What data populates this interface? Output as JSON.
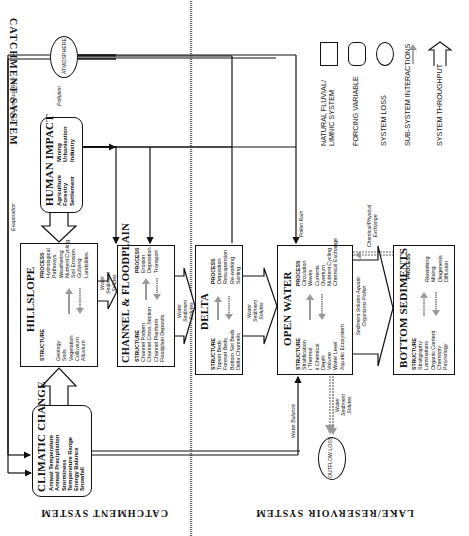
{
  "diagram": {
    "orientation": "rotated 90 degrees counter-clockwise",
    "regions": {
      "catchment": "CATCHMENT SYSTEM",
      "lake": "LAKE/RESERVOIR SYSTEM"
    },
    "nodes": {
      "climatic_change": {
        "title": "CLIMATIC CHANGE",
        "items": [
          "Annual Temperature",
          "Annual Precipitation",
          "Storminess",
          "Temperature Range",
          "Energy Balance",
          "Snowfall"
        ]
      },
      "human_impact": {
        "title": "HUMAN IMPACT",
        "items_col1": [
          "Agriculture",
          "Forestry",
          "Settlement"
        ],
        "items_col2": [
          "Mining",
          "Urbanisation",
          "Industry"
        ]
      },
      "atmosphere": {
        "title": "ATMOSPHERE"
      },
      "hillslope": {
        "title": "HILLSLOPE",
        "structure_label": "STRUCTURE",
        "process_label": "PROCESS",
        "structure": [
          "Geology",
          "Soils",
          "Vegetation",
          "Colluvium",
          "Alluvium"
        ],
        "process": [
          "Hydrological",
          "Pathways",
          "Weathering",
          "Nutrient Cycling",
          "Soil Erosion",
          "Gullying",
          "Landslides"
        ]
      },
      "channel_floodplain": {
        "title": "CHANNEL & FLOODPLAIN",
        "structure_label": "STRUCTURE",
        "process_label": "PROCESS",
        "structure": [
          "Channel Pattern",
          "Channel Cross Section",
          "Channel Planform",
          "Floodplain Deposits"
        ],
        "process": [
          "Erosion",
          "Deposition",
          "Transport"
        ]
      },
      "delta": {
        "title": "DELTA",
        "structure_label": "STRUCTURE",
        "process_label": "PROCESS",
        "structure": [
          "Topset Beds",
          "Foreset Beds",
          "Bottom Set Beds",
          "Delta Channels"
        ],
        "process": [
          "Deposition",
          "Resuspension",
          "Re-working",
          "Sorting"
        ]
      },
      "open_water": {
        "title": "OPEN WATER",
        "structure_label": "STRUCTURE",
        "process_label": "PROCESS",
        "structure": [
          "Stratification",
          "i Thermal",
          "ii Chemical",
          "Depth",
          "Volume",
          "Water Level",
          "Aquatic Ecosystem"
        ],
        "process": [
          "Circulation",
          "Waves",
          "Currents",
          "Overturn",
          "Nutrient Cycling",
          "Chemical Exchange"
        ]
      },
      "bottom_sediments": {
        "title": "BOTTOM SEDIMENTS",
        "structure_label": "STRUCTURE",
        "process_label": "PROCESS",
        "structure": [
          "Stratigraphy",
          "Laminations",
          "Organic Content",
          "Chemistry",
          "Palynology"
        ],
        "process": [
          "Reworking",
          "Mixing",
          "Diagenesis",
          "Diffusion"
        ]
      },
      "outflow_loss": {
        "title": "OUTFLOW LOSS"
      }
    },
    "flow_labels": {
      "evaporation": "Evaporation",
      "pollution_acid_rain": "Pollution/Acid Rain",
      "pollution": "Pollution",
      "pollen_rain": "Pollen Rain",
      "hillslope_to_channel": "Water Sediment Solutes",
      "channel_to_delta": "Water Sediment Solutes",
      "delta_to_open_water": "Water Sediment Solutes",
      "open_water_to_sediments": "Sediment Solutes Aquatic Organisms Pollen",
      "chemical_exchange": "Chemical/Physical Exchange",
      "water_balance": "Water Balance",
      "outflow": "Water Sediment Solutes"
    },
    "legend": [
      {
        "symbol": "rectangle",
        "label": "NATURAL FLUVIAL/ LIMNIC SYSTEM"
      },
      {
        "symbol": "rounded-rectangle",
        "label": "FORCING VARIABLE"
      },
      {
        "symbol": "ellipse",
        "label": "SYSTEM LOSS"
      },
      {
        "symbol": "thin-grey-arrow",
        "label": "SUB-SYSTEM INTERACTIONS"
      },
      {
        "symbol": "open-block-arrow",
        "label": "SYSTEM THROUGHPUT"
      }
    ]
  }
}
